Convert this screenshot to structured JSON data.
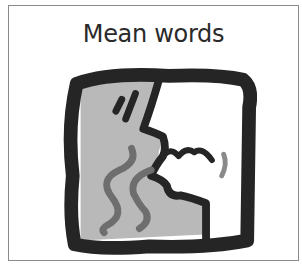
{
  "card": {
    "title": "Mean words",
    "pictogram": "mean-words-face-icon"
  },
  "colors": {
    "outline": "#252525",
    "background_gray": "#b9b9b9",
    "wave_gray": "#6e6e6e",
    "face_white": "#ffffff"
  }
}
